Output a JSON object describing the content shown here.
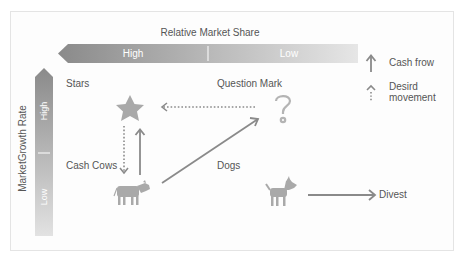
{
  "diagram": {
    "x_axis": {
      "title": "Relative Market Share",
      "high_label": "High",
      "low_label": "Low"
    },
    "y_axis": {
      "title": "MarketGrowth Rate",
      "high_label": "High",
      "low_label": "Low"
    },
    "quadrants": [
      {
        "label": "Stars",
        "icon": "star-icon"
      },
      {
        "label": "Question Mark",
        "icon": "question-mark-icon"
      },
      {
        "label": "Cash Cows",
        "icon": "cow-icon"
      },
      {
        "label": "Dogs",
        "icon": "dog-icon"
      }
    ],
    "arrows": [
      {
        "from": "Cash Cows",
        "to": "Stars",
        "type": "solid"
      },
      {
        "from": "Cash Cows",
        "to": "Question Mark",
        "type": "solid"
      },
      {
        "from": "Question Mark",
        "to": "Stars",
        "type": "dotted"
      },
      {
        "from": "Stars",
        "to": "Cash Cows",
        "type": "dotted"
      },
      {
        "from": "Dogs",
        "to": "Divest",
        "type": "solid"
      }
    ],
    "divest_label": "Divest",
    "legend": {
      "cash_flow_label": "Cash frow",
      "desired_movement_line1": "Desird",
      "desired_movement_line2": "movement"
    },
    "colors": {
      "bar_dark": "#8c8c8c",
      "bar_light": "#e2e2e2",
      "icon": "#a9a9a9",
      "arrow": "#8a8a8a"
    }
  }
}
